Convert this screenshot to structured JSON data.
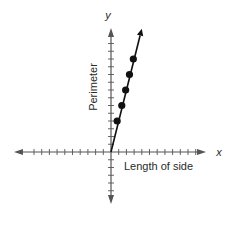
{
  "chart_data": {
    "type": "line",
    "title": "",
    "xlabel": "Length of side",
    "ylabel": "Perimeter",
    "x_axis_letter": "x",
    "y_axis_letter": "y",
    "grid": false,
    "legend": null,
    "tick_labels": false,
    "axis_ticks": {
      "x_positive": 11,
      "x_negative": 10,
      "y_positive": 14,
      "y_negative": 5
    },
    "series": [
      {
        "name": "Perimeter vs. side length",
        "points": [
          {
            "x": 0.8,
            "y": 4
          },
          {
            "x": 1.4,
            "y": 6
          },
          {
            "x": 1.9,
            "y": 8
          },
          {
            "x": 2.4,
            "y": 10
          },
          {
            "x": 2.9,
            "y": 12
          }
        ],
        "line_from_origin": true,
        "arrow_end": {
          "x": 4.0,
          "y": 15.9
        }
      }
    ],
    "xlim": [
      -12,
      12
    ],
    "ylim": [
      -6,
      16
    ]
  },
  "colors": {
    "axis": "#555555",
    "line": "#111111",
    "points": "#111111",
    "text": "#2a2a2a"
  }
}
